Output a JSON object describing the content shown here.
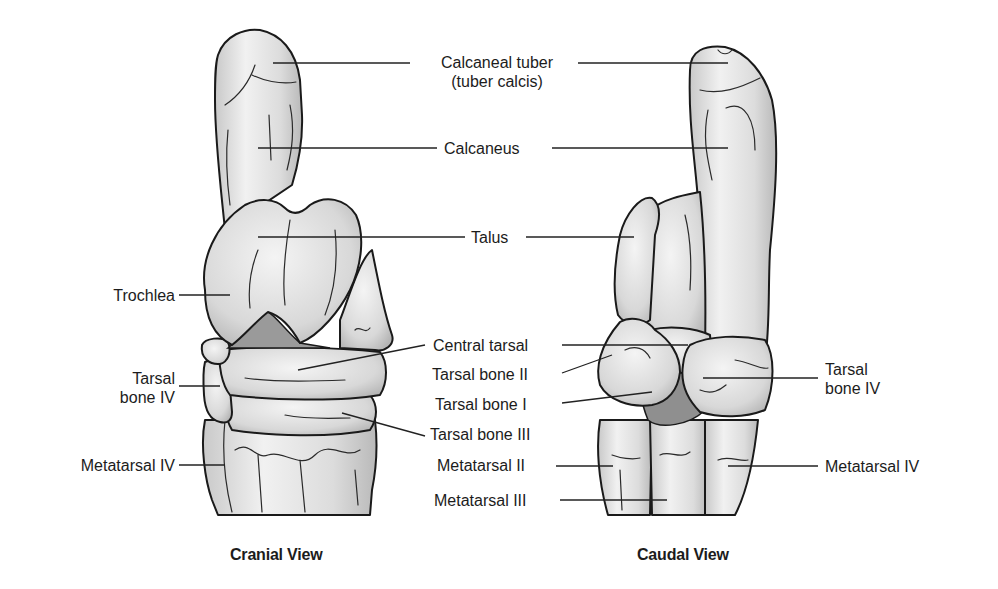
{
  "figure": {
    "views": [
      {
        "id": "cranial",
        "caption": "Cranial View"
      },
      {
        "id": "caudal",
        "caption": "Caudal View"
      }
    ],
    "center_labels": {
      "calcaneal_tuber_line1": "Calcaneal tuber",
      "calcaneal_tuber_line2": "(tuber calcis)",
      "calcaneus": "Calcaneus",
      "talus": "Talus",
      "central_tarsal": "Central tarsal",
      "tarsal_bone_ii": "Tarsal bone II",
      "tarsal_bone_i": "Tarsal bone I",
      "tarsal_bone_iii": "Tarsal bone III",
      "metatarsal_ii": "Metatarsal II",
      "metatarsal_iii": "Metatarsal III"
    },
    "left_labels": {
      "trochlea": "Trochlea",
      "tarsal_bone_iv_line1": "Tarsal",
      "tarsal_bone_iv_line2": "bone IV",
      "metatarsal_iv": "Metatarsal IV"
    },
    "right_labels": {
      "tarsal_bone_iv_line1": "Tarsal",
      "tarsal_bone_iv_line2": "bone IV",
      "metatarsal_iv": "Metatarsal IV"
    },
    "colors": {
      "bone_fill": "#e4e4e4",
      "bone_shadow": "#9a9a9a",
      "outline": "#1a1a1a",
      "background": "#ffffff"
    }
  }
}
